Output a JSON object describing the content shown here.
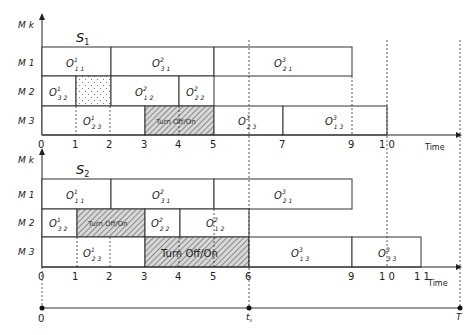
{
  "unit_px": 34.5,
  "origin_x": 42,
  "y_axis_label": "M k",
  "x_axis_label": "Time",
  "charts": [
    {
      "title": "S",
      "title_sub": "1",
      "machines": [
        "M 1",
        "M 2",
        "M 3"
      ],
      "ticks": [
        "0",
        "1",
        "2",
        "3",
        "4",
        "5",
        "7",
        "9",
        "1 0"
      ],
      "tick_values": [
        0,
        1,
        2,
        3,
        4,
        5,
        7,
        9,
        10
      ],
      "blocks": [
        {
          "machine": "M1",
          "start": 0,
          "end": 2,
          "label": "O",
          "sup": "1",
          "sub": "1 1",
          "type": "op"
        },
        {
          "machine": "M1",
          "start": 2,
          "end": 5,
          "label": "O",
          "sup": "2",
          "sub": "3 1",
          "type": "op"
        },
        {
          "machine": "M1",
          "start": 5,
          "end": 9,
          "label": "O",
          "sup": "3",
          "sub": "2 1",
          "type": "op"
        },
        {
          "machine": "M2",
          "start": 0,
          "end": 1,
          "label": "O",
          "sup": "1",
          "sub": "3 2",
          "type": "op"
        },
        {
          "machine": "M2",
          "start": 1,
          "end": 2,
          "label": "",
          "type": "idle-dotted"
        },
        {
          "machine": "M2",
          "start": 2,
          "end": 4,
          "label": "O",
          "sup": "2",
          "sub": "1 2",
          "type": "op"
        },
        {
          "machine": "M2",
          "start": 4,
          "end": 5,
          "label": "O",
          "sup": "2",
          "sub": "2 2",
          "type": "op"
        },
        {
          "machine": "M3",
          "start": 0,
          "end": 3,
          "label": "O",
          "sup": "1",
          "sub": "2 3",
          "type": "op"
        },
        {
          "machine": "M3",
          "start": 3,
          "end": 5,
          "label": "Turn Off/On",
          "type": "hatched"
        },
        {
          "machine": "M3",
          "start": 5,
          "end": 7,
          "label": "O",
          "sup": "3",
          "sub": "2 3",
          "type": "op"
        },
        {
          "machine": "M3",
          "start": 7,
          "end": 10,
          "label": "O",
          "sup": "3",
          "sub": "1 3",
          "type": "op"
        }
      ]
    },
    {
      "title": "S",
      "title_sub": "2",
      "machines": [
        "M 1",
        "M 2",
        "M 3"
      ],
      "ticks": [
        "0",
        "1",
        "2",
        "3",
        "4",
        "5",
        "6",
        "9",
        "1 0",
        "1 1"
      ],
      "tick_values": [
        0,
        1,
        2,
        3,
        4,
        5,
        6,
        9,
        10,
        11
      ],
      "blocks": [
        {
          "machine": "M1",
          "start": 0,
          "end": 2,
          "label": "O",
          "sup": "1",
          "sub": "1 1",
          "type": "op"
        },
        {
          "machine": "M1",
          "start": 2,
          "end": 5,
          "label": "O",
          "sup": "2",
          "sub": "3 1",
          "type": "op"
        },
        {
          "machine": "M1",
          "start": 5,
          "end": 9,
          "label": "O",
          "sup": "3",
          "sub": "2 1",
          "type": "op"
        },
        {
          "machine": "M2",
          "start": 0,
          "end": 1,
          "label": "O",
          "sup": "1",
          "sub": "3 2",
          "type": "op"
        },
        {
          "machine": "M2",
          "start": 1,
          "end": 3,
          "label": "Turn Off/On",
          "type": "hatched"
        },
        {
          "machine": "M2",
          "start": 3,
          "end": 4,
          "label": "O",
          "sup": "2",
          "sub": "2 2",
          "type": "op"
        },
        {
          "machine": "M2",
          "start": 4,
          "end": 6,
          "label": "O",
          "sup": "2",
          "sub": "1 2",
          "type": "op"
        },
        {
          "machine": "M3",
          "start": 0,
          "end": 3,
          "label": "O",
          "sup": "1",
          "sub": "2 3",
          "type": "op"
        },
        {
          "machine": "M3",
          "start": 3,
          "end": 6,
          "label": "Turn Off/On",
          "type": "hatched"
        },
        {
          "machine": "M3",
          "start": 6,
          "end": 9,
          "label": "O",
          "sup": "3",
          "sub": "1 3",
          "type": "op"
        },
        {
          "machine": "M3",
          "start": 9,
          "end": 11,
          "label": "O",
          "sup": "3",
          "sub": "3 3",
          "type": "op"
        }
      ]
    }
  ],
  "timeline": {
    "start_label": "0",
    "mid_label": "t",
    "mid_sub": "s",
    "end_label": "T"
  }
}
